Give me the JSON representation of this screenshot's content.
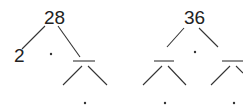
{
  "diagram": {
    "type": "factor-trees",
    "trees": [
      {
        "root": "28",
        "left_leaf": "2",
        "multiply_symbol": "·",
        "right_child": "",
        "right_child_multiply_symbol": "·"
      },
      {
        "root": "36",
        "multiply_symbol": "·",
        "left_child": "",
        "right_child": "",
        "left_child_multiply_symbol": "·",
        "right_child_multiply_symbol": "·"
      }
    ],
    "colors": {
      "ink": "#333333",
      "background": "#ffffff"
    }
  }
}
